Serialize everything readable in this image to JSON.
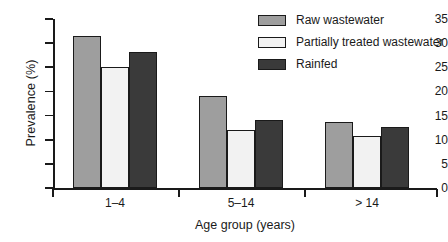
{
  "chart_data": {
    "type": "bar",
    "title": "",
    "xlabel": "Age group  (years)",
    "ylabel": "Prevalence (%)",
    "categories": [
      "1–4",
      "5–14",
      "> 14"
    ],
    "ylim": [
      0,
      35
    ],
    "yticks": [
      0,
      5,
      10,
      15,
      20,
      25,
      30,
      35
    ],
    "ytick_labels": [
      "0",
      "5",
      "10",
      "15",
      "20",
      "25",
      "30",
      "35"
    ],
    "grid": false,
    "legend_position": "top-right",
    "series": [
      {
        "name": "Raw wastewater",
        "color": "#9e9e9e",
        "values": [
          31.5,
          19.0,
          13.6
        ]
      },
      {
        "name": "Partially treated wastewater",
        "color": "#f2f2f2",
        "values": [
          25.0,
          12.0,
          10.8
        ]
      },
      {
        "name": "Rainfed",
        "color": "#3a3a3a",
        "values": [
          28.2,
          14.1,
          12.6
        ]
      }
    ]
  },
  "colors": {
    "axis": "#1a1a1a",
    "background": "#ffffff",
    "raw_wastewater": "#9e9e9e",
    "partially_treated_wastewater": "#f2f2f2",
    "rainfed": "#3a3a3a"
  }
}
